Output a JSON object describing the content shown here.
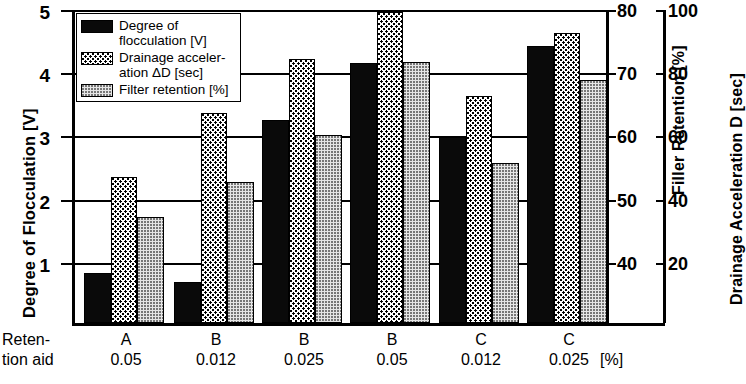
{
  "chart_data": {
    "type": "bar",
    "title": "",
    "categories": [
      "A 0.05",
      "B 0.012",
      "B 0.025",
      "B 0.05",
      "C 0.012",
      "C 0.025"
    ],
    "category_codes": [
      "A",
      "B",
      "B",
      "B",
      "C",
      "C"
    ],
    "category_doses": [
      "0.05",
      "0.012",
      "0.025",
      "0.05",
      "0.012",
      "0.025"
    ],
    "xlabel": "Reten-\ntion aid",
    "xunit": "[%]",
    "grid": true,
    "legend_position": "top-left",
    "series": [
      {
        "name": "Degree of flocculation [V]",
        "key": "floc",
        "axis": "left",
        "values": [
          0.8,
          0.65,
          3.25,
          4.15,
          2.97,
          4.43
        ],
        "unit": "V"
      },
      {
        "name": "Drainage acceleration ΔD [sec]",
        "key": "drain",
        "axis": "right2",
        "values": [
          2.33,
          3.35,
          4.22,
          4.97,
          3.63,
          4.63
        ],
        "values_sec": [
          46.6,
          67.0,
          84.4,
          99.4,
          72.6,
          92.6
        ],
        "unit": "sec"
      },
      {
        "name": "Filter retention [%]",
        "key": "filt",
        "axis": "right1",
        "values": [
          1.7,
          2.25,
          3.0,
          4.17,
          2.55,
          3.88
        ],
        "values_pct": [
          46.8,
          51.3,
          58.0,
          69.7,
          53.5,
          68.8
        ],
        "unit": "%"
      }
    ],
    "axes": {
      "left": {
        "label": "Degree of Flocculation [V]",
        "ticks": [
          1,
          2,
          3,
          4,
          5
        ],
        "tick_labels": [
          "1",
          "2",
          "3",
          "4",
          "5"
        ],
        "range": [
          0,
          5
        ]
      },
      "right1": {
        "label": "Filler Retention [%]",
        "ticks": [
          40,
          50,
          60,
          70,
          80
        ],
        "tick_labels": [
          "40",
          "50",
          "60",
          "70",
          "80"
        ],
        "range": [
          30,
          80
        ]
      },
      "right2": {
        "label": "Drainage Acceleration  D [sec]",
        "ticks": [
          20,
          40,
          60,
          80,
          100
        ],
        "tick_labels": [
          "20",
          "40",
          "60",
          "80",
          "100"
        ],
        "range": [
          0,
          100
        ]
      }
    }
  },
  "legend": {
    "items": [
      {
        "label": "Degree of\nflocculation [V]",
        "swatch": "floc"
      },
      {
        "label": "Drainage acceler-\nation ΔD [sec]",
        "swatch": "drain"
      },
      {
        "label": "Filter retention [%]",
        "swatch": "filt"
      }
    ]
  },
  "colors": {
    "flocculation": "#0a0a0a",
    "drainage": "#ffffff",
    "filter_retention": "#e6e6e6",
    "axis": "#000000"
  }
}
